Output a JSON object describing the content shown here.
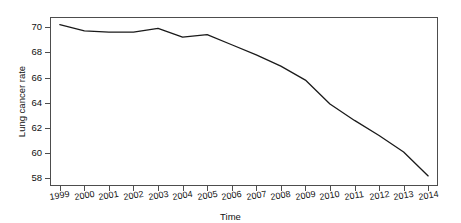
{
  "chart_data": {
    "type": "line",
    "title": "",
    "xlabel": "Time",
    "ylabel": "Lung cancer rate",
    "x": [
      1999,
      2000,
      2001,
      2002,
      2003,
      2004,
      2005,
      2006,
      2007,
      2008,
      2009,
      2010,
      2011,
      2012,
      2013,
      2014
    ],
    "xtick_labels": [
      "1999",
      "2000",
      "2001",
      "2002",
      "2003",
      "2004",
      "2005",
      "2006",
      "2007",
      "2008",
      "2009",
      "2010",
      "2011",
      "2012",
      "2013",
      "2014"
    ],
    "values": [
      70.2,
      69.7,
      69.6,
      69.6,
      69.9,
      69.2,
      69.4,
      68.6,
      67.8,
      66.9,
      65.8,
      63.9,
      62.6,
      61.4,
      60.1,
      58.2
    ],
    "ytick_labels": [
      "58",
      "60",
      "62",
      "64",
      "66",
      "68",
      "70"
    ],
    "yticks": [
      58,
      60,
      62,
      64,
      66,
      68,
      70
    ],
    "ylim": [
      57.4,
      70.8
    ],
    "xlim": [
      1998.6,
      2014.4
    ],
    "grid": false,
    "legend": false,
    "series": [
      {
        "name": "Lung cancer rate",
        "color": "#1a1a1a",
        "values": [
          70.2,
          69.7,
          69.6,
          69.6,
          69.9,
          69.2,
          69.4,
          68.6,
          67.8,
          66.9,
          65.8,
          63.9,
          62.6,
          61.4,
          60.1,
          58.2
        ]
      }
    ]
  },
  "axis": {
    "frame_color": "#4d4d4d",
    "background": "#ffffff"
  }
}
